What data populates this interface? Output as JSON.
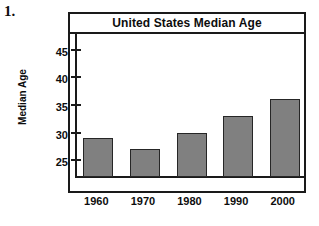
{
  "problem": {
    "number": "1."
  },
  "chart_data": {
    "type": "bar",
    "title": "United States Median Age",
    "xlabel": "",
    "ylabel": "Median Age",
    "categories": [
      "1960",
      "1970",
      "1980",
      "1990",
      "2000"
    ],
    "values": [
      29,
      27,
      30,
      33,
      36
    ],
    "series": [
      {
        "name": "Median Age",
        "values": [
          29,
          27,
          30,
          33,
          36
        ]
      }
    ],
    "ylim": [
      22,
      48
    ],
    "yticks": [
      25,
      30,
      35,
      40,
      45
    ],
    "ytick_labels": [
      "25",
      "30",
      "35",
      "40",
      "45"
    ],
    "grid": false,
    "legend": false,
    "bar_color": "#808080",
    "bar_edge_color": "#262626",
    "axis_color": "#1a1a1a",
    "background": "#ffffff"
  }
}
